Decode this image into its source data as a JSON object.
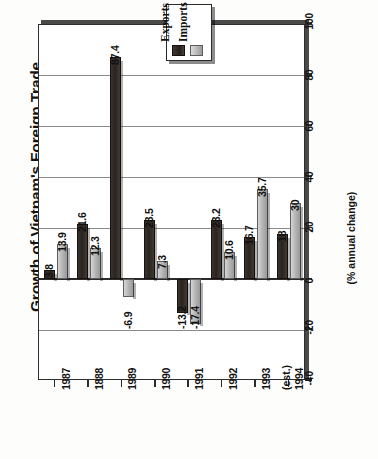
{
  "chart_data": {
    "type": "bar",
    "title": "Growth of Vietnam's Foreign Trade",
    "xlabel": "",
    "ylabel": "(% annual change)",
    "ylim": [
      -40,
      100
    ],
    "yticks": [
      -40,
      -20,
      0,
      20,
      40,
      60,
      80,
      100
    ],
    "ytick_labels": [
      "-40",
      "-20",
      "0",
      "20",
      "40",
      "60",
      "80",
      "100"
    ],
    "grid": true,
    "grid_axis": "y",
    "legend_position": "top-center",
    "orientation": "vertical",
    "categories": [
      "1987",
      "1888",
      "1989",
      "1990",
      "1991",
      "1992",
      "1993",
      "1994"
    ],
    "category_sublabels": [
      "",
      "",
      "",
      "",
      "",
      "",
      "",
      "(est.)"
    ],
    "series": [
      {
        "name": "Exports",
        "color": "#2a2420",
        "values": [
          3.8,
          21.6,
          87.4,
          23.5,
          -13.2,
          23.2,
          16.7,
          18
        ],
        "labels": [
          "3.8",
          "21.6",
          "87.4",
          "23.5",
          "-13.2",
          "23.2",
          "16.7",
          "18"
        ]
      },
      {
        "name": "Imports",
        "color": "#b4b4b4",
        "values": [
          13.9,
          12.3,
          -6.9,
          7.3,
          -17.4,
          10.6,
          35.7,
          30
        ],
        "labels": [
          "13.9",
          "12.3",
          "-6.9",
          "7.3",
          "-17.4",
          "10.6",
          "35.7",
          "30"
        ]
      }
    ]
  },
  "legend": {
    "items": [
      {
        "label": "Exports",
        "swatch": "exports-swatch"
      },
      {
        "label": "Imports",
        "swatch": "imports-swatch"
      }
    ]
  }
}
